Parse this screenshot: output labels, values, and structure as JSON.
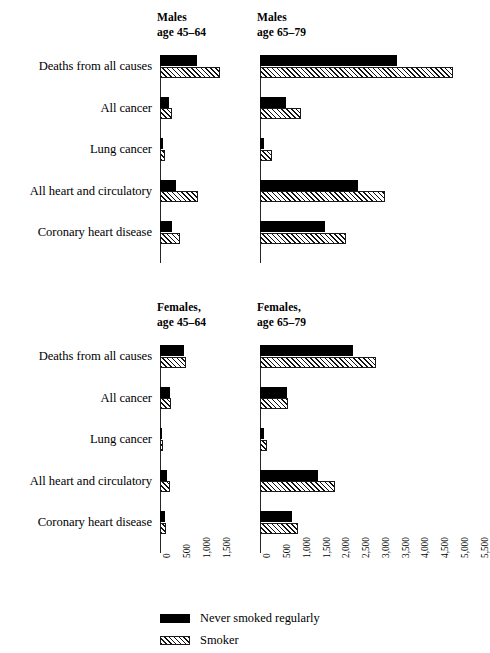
{
  "chart_data": {
    "type": "bar",
    "title": "",
    "subtitle": "",
    "orientation": "horizontal",
    "xlabel": "",
    "ylabel": "",
    "grid": false,
    "legend_position": "bottom-left",
    "categories": [
      "Deaths from all causes",
      "All cancer",
      "Lung cancer",
      "All heart and circulatory",
      "Coronary heart disease"
    ],
    "series_names": [
      "Never smoked regularly",
      "Smoker"
    ],
    "panels": [
      {
        "id": "males-45-64",
        "title_line1": "Males",
        "title_line2": "age 45–64",
        "xlim": [
          0,
          1750
        ],
        "xticks": [
          0,
          500,
          1000,
          1500
        ],
        "xtick_labels": [
          "0",
          "500",
          "1,000",
          "1,500"
        ],
        "series": [
          {
            "name": "Never smoked regularly",
            "values": [
              930,
              220,
              70,
              410,
              290
            ]
          },
          {
            "name": "Smoker",
            "values": [
              1490,
              300,
              130,
              940,
              510
            ]
          }
        ]
      },
      {
        "id": "males-65-79",
        "title_line1": "Males",
        "title_line2": "age 65–79",
        "xlim": [
          0,
          5700
        ],
        "xticks": [
          0,
          500,
          1000,
          1500,
          2000,
          2500,
          3000,
          3500,
          4000,
          4500,
          5000,
          5500
        ],
        "xtick_labels": [
          "0",
          "500",
          "1,000",
          "1,500",
          "2,000",
          "2,500",
          "3,000",
          "3,500",
          "4,000",
          "4,500",
          "5,000",
          "5,500"
        ],
        "series": [
          {
            "name": "Never smoked regularly",
            "values": [
              3480,
              670,
              100,
              2480,
              1640
            ]
          },
          {
            "name": "Smoker",
            "values": [
              4900,
              1050,
              310,
              3160,
              2180
            ]
          }
        ]
      },
      {
        "id": "females-45-64",
        "title_line1": "Females,",
        "title_line2": "age 45–64",
        "xlim": [
          0,
          1750
        ],
        "xticks": [
          0,
          500,
          1000,
          1500
        ],
        "xtick_labels": [
          "0",
          "500",
          "1,000",
          "1,500"
        ],
        "series": [
          {
            "name": "Never smoked regularly",
            "values": [
              590,
              250,
              40,
              170,
              130
            ]
          },
          {
            "name": "Smoker",
            "values": [
              640,
              270,
              70,
              250,
              150
            ]
          }
        ]
      },
      {
        "id": "females-65-79",
        "title_line1": "Females,",
        "title_line2": "age 65–79",
        "xlim": [
          0,
          5700
        ],
        "xticks": [
          0,
          500,
          1000,
          1500,
          2000,
          2500,
          3000,
          3500,
          4000,
          4500,
          5000,
          5500
        ],
        "xtick_labels": [
          "0",
          "500",
          "1,000",
          "1,500",
          "2,000",
          "2,500",
          "3,000",
          "3,500",
          "4,000",
          "4,500",
          "5,000",
          "5,500"
        ],
        "series": [
          {
            "name": "Never smoked regularly",
            "values": [
              2350,
              680,
              90,
              1480,
              800
            ]
          },
          {
            "name": "Smoker",
            "values": [
              2930,
              720,
              180,
              1900,
              960
            ]
          }
        ]
      }
    ]
  },
  "legend": {
    "items": [
      {
        "label": "Never smoked regularly",
        "style": "solid-black"
      },
      {
        "label": "Smoker",
        "style": "hatched"
      }
    ]
  },
  "colors": {
    "never_smoked": "#000000",
    "smoker_hatch": "#111111",
    "axis": "#262626",
    "background": "#ffffff"
  }
}
